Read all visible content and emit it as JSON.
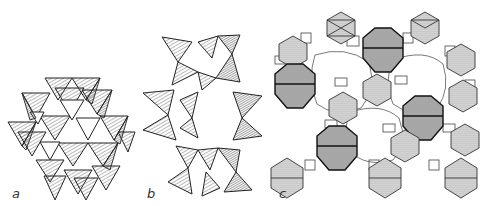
{
  "figure": {
    "panels": [
      {
        "id": "a",
        "label": "a",
        "description": "packed tetrahedra framework"
      },
      {
        "id": "b",
        "label": "b",
        "description": "ring of corner-sharing tetrahedra"
      },
      {
        "id": "c",
        "label": "c",
        "description": "framework of truncated octahedra (sodalite cages) linked by prisms"
      }
    ]
  },
  "colors": {
    "line": "#222222",
    "hatch": "#555555",
    "dotted_fill": "#cfcfcf",
    "background": "#ffffff"
  }
}
